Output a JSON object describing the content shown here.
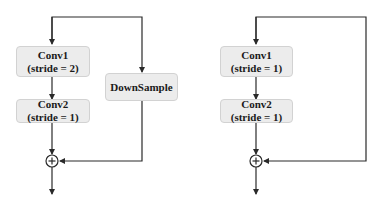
{
  "diagrams": [
    {
      "name": "downsample-residual-block",
      "blocks": [
        {
          "id": "conv1",
          "title": "Conv1",
          "subtitle": "(stride = 2)"
        },
        {
          "id": "conv2",
          "title": "Conv2",
          "subtitle": "(stride = 1)"
        },
        {
          "id": "downsample",
          "title": "DownSample",
          "subtitle": ""
        }
      ],
      "sum_symbol": "+"
    },
    {
      "name": "identity-residual-block",
      "blocks": [
        {
          "id": "conv1",
          "title": "Conv1",
          "subtitle": "(stride = 1)"
        },
        {
          "id": "conv2",
          "title": "Conv2",
          "subtitle": "(stride = 1)"
        }
      ],
      "sum_symbol": "+"
    }
  ],
  "colors": {
    "block_fill": "#ececec",
    "block_border": "#d2d2d2",
    "line": "#2a2a2a",
    "text": "#1a1a1a"
  }
}
